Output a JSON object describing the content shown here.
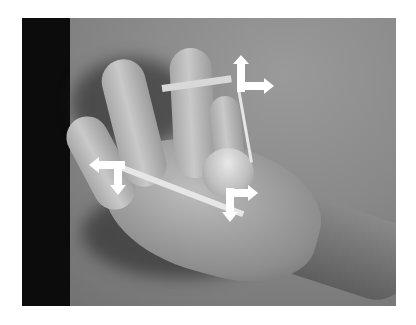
{
  "image": {
    "description": "Grayscale photograph of a hand with a rubber band stretched between fingers and thumb, annotated with white directional arrows",
    "background_color": "#ffffff",
    "photo_tone": "grayscale"
  },
  "annotations": {
    "arrow_groups": [
      {
        "name": "fingertip-arrows",
        "arrows": [
          "up",
          "right"
        ]
      },
      {
        "name": "left-arrows",
        "arrows": [
          "left",
          "down"
        ]
      },
      {
        "name": "thumb-arrows",
        "arrows": [
          "down",
          "right"
        ]
      }
    ],
    "arrow_color": "#ffffff"
  }
}
